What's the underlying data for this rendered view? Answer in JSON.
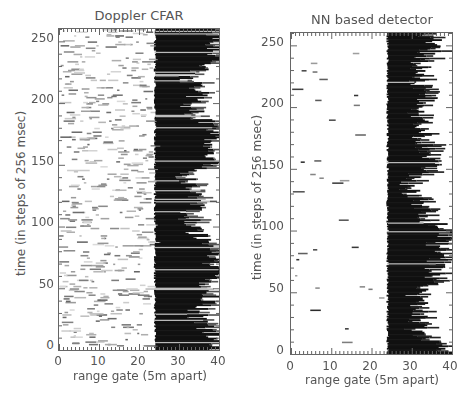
{
  "chart_data": [
    {
      "type": "heatmap",
      "title": "Doppler CFAR",
      "xlabel": "range gate (5m apart)",
      "ylabel": "time (in steps of 256 msec)",
      "xlim": [
        0,
        40
      ],
      "ylim": [
        0,
        260
      ],
      "xticks": [
        0,
        10,
        20,
        30,
        40
      ],
      "yticks": [
        0,
        50,
        100,
        150,
        200,
        250
      ],
      "colormap": "grayscale (black = detection)",
      "grid": false,
      "description": "Detections concentrated at range gates ~24-40 (black band), with scattered gray clutter detections across gates 0-23",
      "target_band": {
        "start_gate": 24,
        "end_gate_range": [
          30,
          40
        ]
      },
      "target_extent_by_time": [
        {
          "t": 0,
          "end": 40
        },
        {
          "t": 10,
          "end": 40
        },
        {
          "t": 20,
          "end": 36
        },
        {
          "t": 30,
          "end": 34
        },
        {
          "t": 40,
          "end": 38
        },
        {
          "t": 50,
          "end": 36
        },
        {
          "t": 60,
          "end": 40
        },
        {
          "t": 70,
          "end": 38
        },
        {
          "t": 80,
          "end": 40
        },
        {
          "t": 90,
          "end": 36
        },
        {
          "t": 100,
          "end": 33
        },
        {
          "t": 110,
          "end": 32
        },
        {
          "t": 120,
          "end": 35
        },
        {
          "t": 130,
          "end": 33
        },
        {
          "t": 140,
          "end": 31
        },
        {
          "t": 150,
          "end": 38
        },
        {
          "t": 160,
          "end": 40
        },
        {
          "t": 170,
          "end": 37
        },
        {
          "t": 180,
          "end": 40
        },
        {
          "t": 190,
          "end": 34
        },
        {
          "t": 200,
          "end": 33
        },
        {
          "t": 210,
          "end": 35
        },
        {
          "t": 220,
          "end": 32
        },
        {
          "t": 230,
          "end": 36
        },
        {
          "t": 240,
          "end": 40
        },
        {
          "t": 250,
          "end": 38
        },
        {
          "t": 260,
          "end": 40
        }
      ],
      "clutter_density": 0.55
    },
    {
      "type": "heatmap",
      "title": "NN based detector",
      "xlabel": "range gate (5m apart)",
      "ylabel": "time (in steps of 256 msec)",
      "xlim": [
        0,
        40
      ],
      "ylim": [
        0,
        260
      ],
      "xticks": [
        0,
        10,
        20,
        30,
        40
      ],
      "yticks": [
        0,
        50,
        100,
        150,
        200,
        250
      ],
      "colormap": "grayscale (black = detection)",
      "grid": false,
      "description": "Cleaner detection: solid black band from range gate ~24 extending to ~30-40, sparse isolated clutter detections in gates 0-23",
      "target_band": {
        "start_gate": 24,
        "end_gate_range": [
          28,
          40
        ]
      },
      "target_extent_by_time": [
        {
          "t": 0,
          "end": 40
        },
        {
          "t": 10,
          "end": 35
        },
        {
          "t": 20,
          "end": 31
        },
        {
          "t": 30,
          "end": 31
        },
        {
          "t": 40,
          "end": 32
        },
        {
          "t": 50,
          "end": 30
        },
        {
          "t": 60,
          "end": 36
        },
        {
          "t": 70,
          "end": 35
        },
        {
          "t": 80,
          "end": 38
        },
        {
          "t": 90,
          "end": 36
        },
        {
          "t": 100,
          "end": 40
        },
        {
          "t": 110,
          "end": 32
        },
        {
          "t": 120,
          "end": 33
        },
        {
          "t": 130,
          "end": 30
        },
        {
          "t": 140,
          "end": 29
        },
        {
          "t": 150,
          "end": 34
        },
        {
          "t": 160,
          "end": 35
        },
        {
          "t": 170,
          "end": 33
        },
        {
          "t": 180,
          "end": 32
        },
        {
          "t": 190,
          "end": 31
        },
        {
          "t": 200,
          "end": 33
        },
        {
          "t": 210,
          "end": 34
        },
        {
          "t": 220,
          "end": 32
        },
        {
          "t": 230,
          "end": 31
        },
        {
          "t": 240,
          "end": 33
        },
        {
          "t": 250,
          "end": 36
        },
        {
          "t": 260,
          "end": 34
        }
      ],
      "clutter_density": 0.12
    }
  ],
  "panels": [
    {
      "title": "Doppler CFAR",
      "xlabel": "range gate (5m apart)",
      "ylabel": "time (in steps of 256 msec)",
      "xticks": [
        "0",
        "10",
        "20",
        "30",
        "40"
      ],
      "yticks": [
        "0",
        "50",
        "100",
        "150",
        "200",
        "250"
      ]
    },
    {
      "title": "NN based detector",
      "xlabel": "range gate (5m apart)",
      "ylabel": "time (in steps of 256 msec)",
      "xticks": [
        "0",
        "10",
        "20",
        "30",
        "40"
      ],
      "yticks": [
        "0",
        "50",
        "100",
        "150",
        "200",
        "250"
      ]
    }
  ]
}
